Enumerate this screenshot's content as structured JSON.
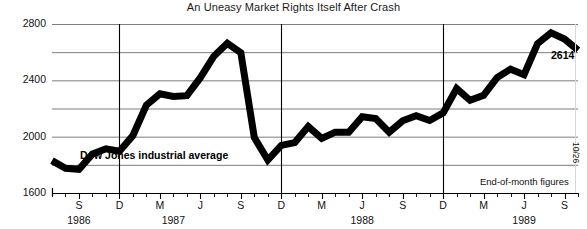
{
  "chart_data": {
    "type": "line",
    "title": "An Uneasy Market Rights Itself After Crash",
    "series_label": "Dow Jones industrial average",
    "note": "End-of-month figures",
    "crash_marker": "10/26",
    "last_value_label": "2614",
    "xlabel": "",
    "ylabel": "",
    "ylim": [
      1600,
      2800
    ],
    "yticks": [
      2800,
      2400,
      2000,
      1600
    ],
    "yticks_minor": [
      2600,
      2200,
      1800
    ],
    "grid": true,
    "legend_position": "inline",
    "year_labels": [
      "1986",
      "1987",
      "1988",
      "1989"
    ],
    "month_ticks": [
      "S",
      "D",
      "M",
      "J",
      "S",
      "D",
      "M",
      "J",
      "S",
      "D",
      "M",
      "J",
      "S"
    ],
    "x": [
      "1986-07",
      "1986-08",
      "1986-09",
      "1986-10",
      "1986-11",
      "1986-12",
      "1987-01",
      "1987-02",
      "1987-03",
      "1987-04",
      "1987-05",
      "1987-06",
      "1987-07",
      "1987-08",
      "1987-09",
      "1987-10",
      "1987-11",
      "1987-12",
      "1988-01",
      "1988-02",
      "1988-03",
      "1988-04",
      "1988-05",
      "1988-06",
      "1988-07",
      "1988-08",
      "1988-09",
      "1988-10",
      "1988-11",
      "1988-12",
      "1989-01",
      "1989-02",
      "1989-03",
      "1989-04",
      "1989-05",
      "1989-06",
      "1989-07",
      "1989-08",
      "1989-09",
      "1989-10"
    ],
    "values": [
      1830,
      1775,
      1768,
      1878,
      1914,
      1896,
      2008,
      2224,
      2305,
      2286,
      2291,
      2419,
      2572,
      2663,
      2596,
      1994,
      1834,
      1938,
      1958,
      2072,
      1988,
      2032,
      2031,
      2142,
      2128,
      2032,
      2113,
      2149,
      2115,
      2169,
      2342,
      2258,
      2294,
      2419,
      2480,
      2440,
      2661,
      2737,
      2693,
      2614
    ]
  }
}
